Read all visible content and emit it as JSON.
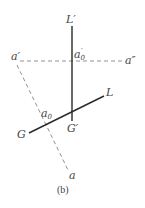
{
  "diagram": {
    "caption": "(b)",
    "labels": {
      "L_prime": "L′",
      "a_prime": "a′",
      "a0_prime_base": "a",
      "a0_prime_sub": "0",
      "a0_prime_mark": "′",
      "a_double_prime": "a″",
      "L": "L",
      "G": "G",
      "a0_base": "a",
      "a0_sub": "0",
      "G_prime": "G′",
      "a": "a"
    },
    "colors": {
      "solid_line": "#2a2a2a",
      "dashed_line": "#777777",
      "text": "#444444"
    }
  }
}
